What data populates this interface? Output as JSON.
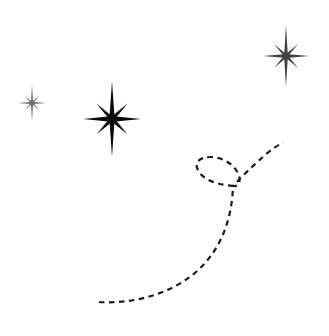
{
  "canvas": {
    "width": 329,
    "height": 336,
    "background_color": "#ffffff",
    "title": "Sparkle stars with dashed swirl path"
  },
  "palette": {
    "star_primary": "#0a0a0a",
    "star_secondary": "#3f3f3f",
    "star_tertiary": "#6e6e6e",
    "path_stroke": "#1a1a1a"
  },
  "stars": [
    {
      "id": "star-large",
      "label": "Large sparkle star",
      "icon": "sparkle-star-icon",
      "center_x": 112,
      "center_y": 119,
      "vertical_radius": 38,
      "horizontal_radius": 29,
      "diagonal_radius": 22,
      "core_radius": 7,
      "color": "#0a0a0a",
      "points": 8
    },
    {
      "id": "star-top-right",
      "label": "Top right sparkle star",
      "icon": "sparkle-star-icon",
      "center_x": 286,
      "center_y": 56,
      "vertical_radius": 31,
      "horizontal_radius": 23,
      "diagonal_radius": 17,
      "core_radius": 5,
      "color": "#3f3f3f",
      "points": 8
    },
    {
      "id": "star-left-small",
      "label": "Small left sparkle star",
      "icon": "sparkle-star-icon",
      "center_x": 32,
      "center_y": 103,
      "vertical_radius": 18,
      "horizontal_radius": 14,
      "diagonal_radius": 10,
      "core_radius": 3,
      "color": "#6e6e6e",
      "points": 8
    }
  ],
  "path": {
    "id": "dashed-swirl-path",
    "label": "Dashed swirl trail with loop",
    "stroke_color": "#1a1a1a",
    "stroke_width": 2.2,
    "dash_length": 5.5,
    "gap_length": 4.5,
    "linecap": "butt",
    "start_point": [
      99,
      302
    ],
    "end_point": [
      283,
      143
    ],
    "loop_crossing_point": [
      233,
      186
    ],
    "loop_left_extent": 196,
    "loop_top_extent": 160,
    "d": "M 99 302 C 130 304 168 296 196 272 C 222 249 232 218 233 186 C 222 185 206 182 199 172 C 193 163 199 157 211 157 C 224 157 236 166 239 176 C 241 183 238 187 233 186 C 241 177 254 165 265 155 C 272 149 278 145 283 143"
  },
  "annotations": {
    "scene_description": "Three eight-pointed sparkle stars in the upper half and a dashed curved trail that sweeps up from the lower left, loops once, and exits toward the upper right."
  }
}
